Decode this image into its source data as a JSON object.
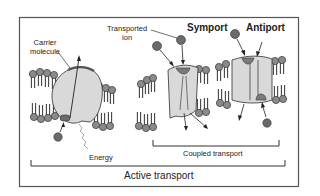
{
  "diagram": {
    "labels": {
      "carrier": [
        "Carrier",
        "molecule"
      ],
      "transported_ion": [
        "Transported",
        "ion"
      ],
      "symport": "Symport",
      "antiport": "Antiport",
      "energy": "Energy",
      "coupled_transport": "Coupled transport",
      "active_transport": "Active transport"
    },
    "colors": {
      "frame": "#555555",
      "protein": "#d9d9d9",
      "protein_stroke": "#444444",
      "ion": "#6b6b6b",
      "lipid_head": "#8a8a8a",
      "text": "#222222"
    }
  }
}
